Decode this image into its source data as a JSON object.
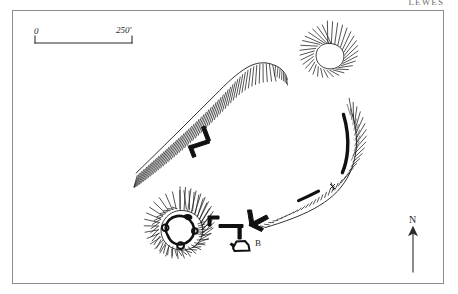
{
  "page": {
    "heading": "LEWES",
    "background_color": "#ffffff",
    "ink_color": "#1a1a1a",
    "frame_color": "#8d8d8d"
  },
  "map": {
    "title": "Earthwork survey plan",
    "scale_bar": {
      "start_label": "0",
      "end_label": "250'",
      "unit": "feet"
    },
    "north_arrow": {
      "label": "N"
    },
    "annotations": [
      {
        "id": "B",
        "label": "B"
      }
    ],
    "features": [
      {
        "name": "round-barrow-north",
        "type": "hachured-circular-mound"
      },
      {
        "name": "ridge-scarp-north",
        "type": "hachured-scarp"
      },
      {
        "name": "ring-enclosure-southwest",
        "type": "hachured-circular-enclosure"
      },
      {
        "name": "rampart-scarp-east",
        "type": "hachured-scarp-with-bank"
      },
      {
        "name": "linear-bank",
        "type": "bank"
      },
      {
        "name": "structure-b",
        "type": "building-outline"
      }
    ]
  }
}
